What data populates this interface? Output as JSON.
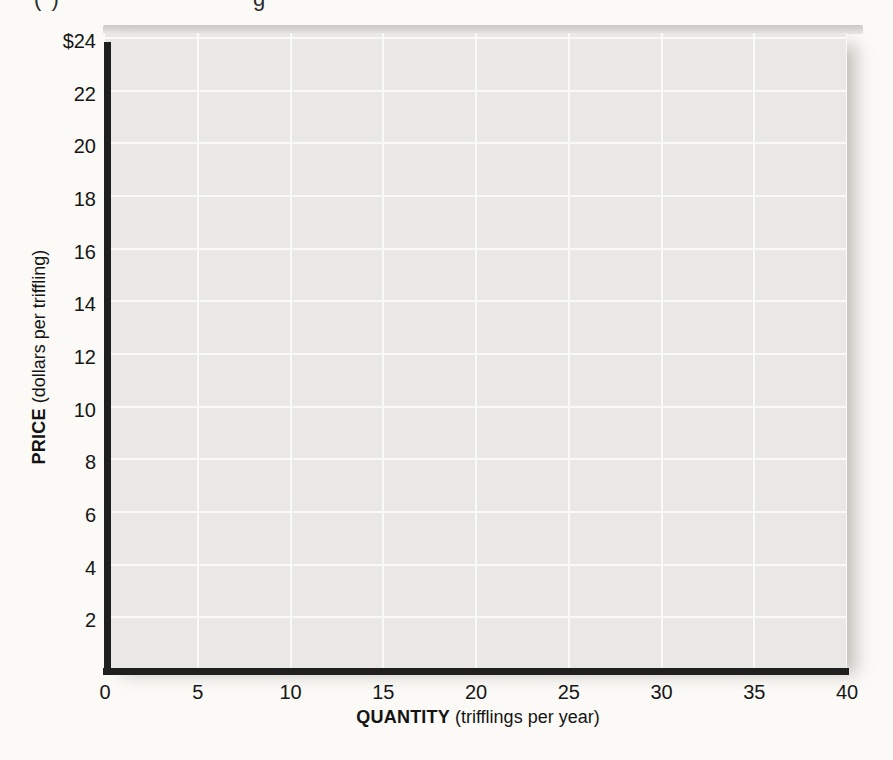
{
  "page": {
    "background_color": "#fbfaf7",
    "cropped_top_fragments": [
      {
        "text": "( )"
      },
      {
        "text": "g"
      }
    ]
  },
  "chart_data": {
    "type": "line",
    "title": "",
    "xlabel": "QUANTITY (trifflings per year)",
    "xlabel_main": "QUANTITY",
    "xlabel_sub": " (trifflings per year)",
    "ylabel": "PRICE (dollars per triffling)",
    "ylabel_main": "PRICE",
    "ylabel_sub": " (dollars per triffling)",
    "xlim": [
      0,
      40
    ],
    "ylim": [
      0,
      24
    ],
    "x_ticks": [
      0,
      5,
      10,
      15,
      20,
      25,
      30,
      35,
      40
    ],
    "y_tick_values": [
      24,
      22,
      20,
      18,
      16,
      14,
      12,
      10,
      8,
      6,
      4,
      2
    ],
    "y_tick_labels": [
      "$24",
      "22",
      "20",
      "18",
      "16",
      "14",
      "12",
      "10",
      "8",
      "6",
      "4",
      "2"
    ],
    "grid": true,
    "legend": false,
    "series": [],
    "colors": {
      "plot_background": "#e9e8e5",
      "gridline": "#f9f9f7",
      "axis": "#1f1f1f",
      "text": "#141414"
    }
  }
}
